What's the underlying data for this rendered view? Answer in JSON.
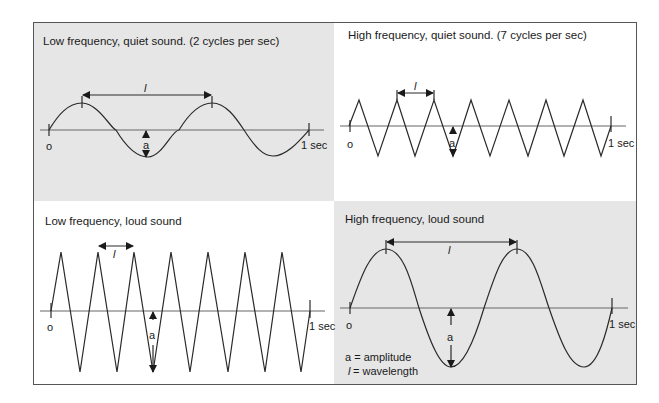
{
  "figure": {
    "panels": [
      {
        "id": "tl",
        "title": "Low frequency, quiet sound. (2 cycles per sec)",
        "background": "#e6e6e6",
        "origin_label": "o",
        "end_label": "1 sec",
        "wavelength_label": "l",
        "amplitude_label": "a",
        "wave_shape": "sine"
      },
      {
        "id": "tr",
        "title": "High frequency, quiet sound. (7 cycles per sec)",
        "background": "#ffffff",
        "origin_label": "o",
        "end_label": "1 sec",
        "wavelength_label": "l",
        "amplitude_label": "a",
        "wave_shape": "triangle"
      },
      {
        "id": "bl",
        "title": "Low frequency, loud sound",
        "background": "#ffffff",
        "origin_label": "o",
        "end_label": "1 sec",
        "wavelength_label": "l",
        "amplitude_label": "a",
        "wave_shape": "triangle"
      },
      {
        "id": "br",
        "title": "High frequency, loud sound",
        "background": "#e6e6e6",
        "origin_label": "o",
        "end_label": "1 sec",
        "wavelength_label": "l",
        "amplitude_label": "a",
        "wave_shape": "sine"
      }
    ],
    "legend": {
      "amplitude": "a = amplitude",
      "wavelength_symbol": "l",
      "wavelength": "= wavelength"
    }
  }
}
